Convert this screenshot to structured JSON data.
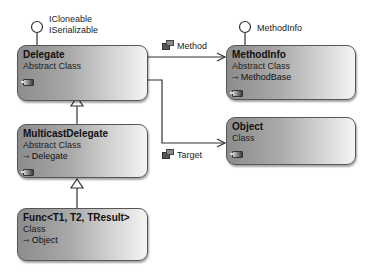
{
  "diagram": {
    "type": "class-diagram",
    "classes": [
      {
        "id": "delegate",
        "name": "Delegate",
        "kind": "Abstract Class",
        "base": null,
        "interfaces": [
          "ICloneable",
          "ISerializable"
        ]
      },
      {
        "id": "methodinfo",
        "name": "MethodInfo",
        "kind": "Abstract Class",
        "base": "MethodBase",
        "interfaces": [
          "MethodInfo"
        ]
      },
      {
        "id": "multicastdelegate",
        "name": "MulticastDelegate",
        "kind": "Abstract Class",
        "base": "Delegate"
      },
      {
        "id": "object",
        "name": "Object",
        "kind": "Class",
        "base": null
      },
      {
        "id": "func",
        "name": "Func<T1, T2, TResult>",
        "kind": "Class",
        "base": "Object"
      }
    ],
    "associations": [
      {
        "from": "Delegate",
        "to": "MethodInfo",
        "label": "Method"
      },
      {
        "from": "Delegate",
        "to": "Object",
        "label": "Target"
      }
    ],
    "inheritance": [
      {
        "child": "MulticastDelegate",
        "parent": "Delegate"
      },
      {
        "child": "Func<T1, T2, TResult>",
        "parent": "MulticastDelegate"
      }
    ]
  },
  "lollipops": {
    "delegate_line1": "ICloneable",
    "delegate_line2": "ISerializable",
    "methodinfo": "MethodInfo"
  },
  "boxes": {
    "delegate": {
      "name": "Delegate",
      "kind": "Abstract Class"
    },
    "methodinfo": {
      "name": "MethodInfo",
      "kind": "Abstract Class",
      "base": "MethodBase"
    },
    "multicast": {
      "name": "MulticastDelegate",
      "kind": "Abstract Class",
      "base": "Delegate"
    },
    "object": {
      "name": "Object",
      "kind": "Class"
    },
    "func": {
      "name": "Func<T1, T2, TResult>",
      "kind": "Class",
      "base": "Object"
    }
  },
  "connectors": {
    "method_label": "Method",
    "target_label": "Target"
  },
  "icons": {
    "inherits_arrow": "⇾",
    "association_icon": "property-icon",
    "collapse_chip": "collapse-toggle-icon"
  },
  "colors": {
    "box_dark": "#8c8c8c",
    "box_light": "#f4f4f4",
    "border": "#555555",
    "line": "#333333"
  }
}
